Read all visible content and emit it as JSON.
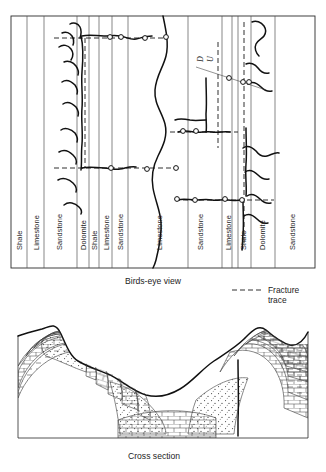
{
  "figure": {
    "title_birdseye": "Birds-eye view",
    "title_cross_section": "Cross section"
  },
  "birdseye": {
    "caption": "Birds-eye view",
    "fault_labels": {
      "down": "D",
      "up": "U"
    },
    "columns": [
      {
        "label": "Shale",
        "x0": 11,
        "x1": 27
      },
      {
        "label": "Limestone",
        "x0": 27,
        "x1": 44
      },
      {
        "label": "Sandstone",
        "x0": 44,
        "x1": 77
      },
      {
        "label": "Dolomite",
        "x0": 77,
        "x1": 89
      },
      {
        "label": "Shale",
        "x0": 89,
        "x1": 99
      },
      {
        "label": "Limestone",
        "x0": 99,
        "x1": 112
      },
      {
        "label": "Sandstone",
        "x0": 112,
        "x1": 128
      },
      {
        "label": "Limestone",
        "x0": 128,
        "x1": 188
      },
      {
        "label": "Sandstone",
        "x0": 188,
        "x1": 222
      },
      {
        "label": "Limestone",
        "x0": 222,
        "x1": 238
      },
      {
        "label": "Shale",
        "x0": 238,
        "x1": 251
      },
      {
        "label": "Dolomite",
        "x0": 251,
        "x1": 275
      },
      {
        "label": "Sandstone",
        "x0": 275,
        "x1": 315
      }
    ]
  },
  "legend": {
    "line1": "Fracture",
    "line2": "trace",
    "symbol": "dashed-line"
  },
  "cross_section": {
    "caption": "Cross section"
  },
  "colors": {
    "ink": "#1a1a1a",
    "bedding": "#555555",
    "background": "#ffffff"
  }
}
